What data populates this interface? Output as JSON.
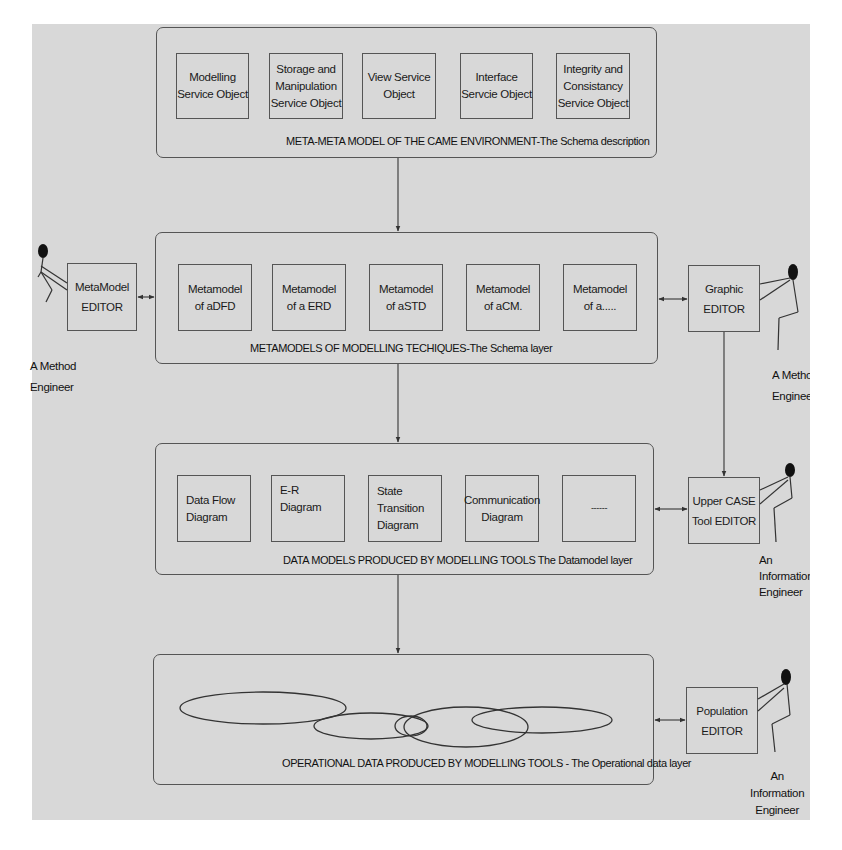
{
  "layers": {
    "meta_meta": {
      "caption": "META-META MODEL OF THE CAME ENVIRONMENT-The Schema description",
      "boxes": [
        {
          "label": "Modelling\nService Object"
        },
        {
          "label": "Storage and\nManipulation\nService Object"
        },
        {
          "label": "View Service\nObject"
        },
        {
          "label": "Interface\nServcie Object"
        },
        {
          "label": "Integrity and\nConsistancy\nService Object"
        }
      ]
    },
    "metamodels": {
      "caption": "METAMODELS OF MODELLING TECHIQUES-The Schema layer",
      "boxes": [
        {
          "label": "Metamodel\nof  aDFD"
        },
        {
          "label": "Metamodel\nof  a ERD"
        },
        {
          "label": "Metamodel\nof  aSTD"
        },
        {
          "label": "Metamodel\nof  aCM."
        },
        {
          "label": "Metamodel\nof  a....."
        }
      ]
    },
    "data_models": {
      "caption": "DATA MODELS  PRODUCED BY MODELLING TOOLS The Datamodel layer",
      "boxes": [
        {
          "label": "Data Flow\nDiagram"
        },
        {
          "label": "E-R\nDiagram"
        },
        {
          "label": "State\nTransition\nDiagram"
        },
        {
          "label": "Communication\nDiagram"
        },
        {
          "label": "------"
        }
      ]
    },
    "operational": {
      "caption": "OPERATIONAL DATA PRODUCED BY MODELLING TOOLS - The Operational data layer",
      "ellipses": [
        {
          "cx": 263,
          "cy": 708,
          "rx": 83,
          "ry": 16
        },
        {
          "cx": 371,
          "cy": 726,
          "rx": 57,
          "ry": 13
        },
        {
          "cx": 411,
          "cy": 726,
          "rx": 16,
          "ry": 10
        },
        {
          "cx": 466,
          "cy": 727,
          "rx": 62,
          "ry": 20
        },
        {
          "cx": 542,
          "cy": 720,
          "rx": 70,
          "ry": 13
        }
      ]
    }
  },
  "editors": {
    "metamodel": {
      "label": "MetaModel\nEDITOR"
    },
    "graphic": {
      "label": "Graphic\nEDITOR"
    },
    "upper_case": {
      "label": "Upper CASE\nTool EDITOR"
    },
    "population": {
      "label": "Population\nEDITOR"
    }
  },
  "actors": {
    "method_engineer_left": {
      "label": "A Method\nEngineer"
    },
    "method_engineer_right": {
      "label": "A Method\nEngineer"
    },
    "information_engineer_1": {
      "label": "An\nInformation\nEngineer"
    },
    "information_engineer_2": {
      "label": "An\nInformation\nEngineer"
    }
  },
  "colors": {
    "background": "#d8d8d8",
    "stroke": "#555555",
    "text": "#1a1a1a"
  }
}
